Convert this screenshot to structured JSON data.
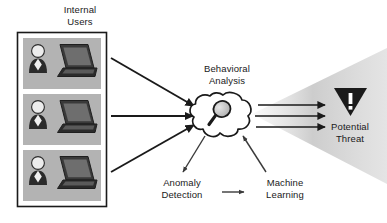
{
  "diagram": {
    "colors": {
      "line": "#1a1a1a",
      "text": "#1a1a1a",
      "card_fill": "#b3b3b3",
      "card_border": "#1a1a1a",
      "icon_dark": "#2b2b2b",
      "icon_light": "#e8e8e8",
      "cone_gray": "#c9c9c9",
      "cloud_fill": "#ffffff",
      "threat_fill": "#1a1a1a",
      "background": "#ffffff"
    },
    "nodes": {
      "internal_users": {
        "label": "Internal\nUsers",
        "icon": "user-laptop-icon",
        "count": 3
      },
      "behavioral_analysis": {
        "label": "Behavioral\nAnalysis",
        "icon": "magnifying-glass-icon",
        "shape": "cloud"
      },
      "anomaly_detection": {
        "label": "Anomaly\nDetection"
      },
      "machine_learning": {
        "label": "Machine\nLearning"
      },
      "potential_threat": {
        "label": "Potential\nThreat",
        "icon": "warning-triangle-icon",
        "glyph": "!"
      }
    },
    "edges": [
      {
        "from": "internal_users",
        "to": "behavioral_analysis",
        "style": "arrow"
      },
      {
        "from": "internal_users",
        "to": "behavioral_analysis",
        "style": "arrow"
      },
      {
        "from": "internal_users",
        "to": "behavioral_analysis",
        "style": "arrow"
      },
      {
        "from": "behavioral_analysis",
        "to": "potential_threat",
        "style": "arrow"
      },
      {
        "from": "behavioral_analysis",
        "to": "potential_threat",
        "style": "arrow"
      },
      {
        "from": "behavioral_analysis",
        "to": "potential_threat",
        "style": "arrow"
      },
      {
        "from": "behavioral_analysis",
        "to": "anomaly_detection",
        "style": "thin-arrow"
      },
      {
        "from": "anomaly_detection",
        "to": "machine_learning",
        "style": "thin-arrow"
      },
      {
        "from": "machine_learning",
        "to": "behavioral_analysis",
        "style": "thin-arrow"
      }
    ]
  }
}
